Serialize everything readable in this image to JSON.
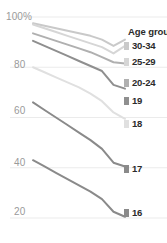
{
  "chart_data": {
    "type": "line",
    "title": "",
    "xlabel": "",
    "ylabel": "",
    "ylim": [
      14,
      104
    ],
    "grid": true,
    "legend_position": "right",
    "legend_title": "Age group",
    "yticks": [
      "100%",
      "80",
      "60",
      "40",
      "20"
    ],
    "ytick_values": [
      100,
      80,
      60,
      40,
      20
    ],
    "x": [
      0,
      1,
      2,
      3,
      4,
      5,
      6,
      7,
      8
    ],
    "series": [
      {
        "name": "30-34",
        "color": "#c9c9c9",
        "values": [
          97.5,
          96.5,
          95.5,
          94.5,
          93.5,
          92.5,
          91.0,
          88.5,
          91.0
        ]
      },
      {
        "name": "25-29",
        "color": "#d6d6d6",
        "values": [
          97.0,
          95.5,
          94.0,
          92.5,
          91.0,
          89.5,
          88.0,
          85.5,
          88.5
        ]
      },
      {
        "name": "20-24",
        "color": "#b0b0b0",
        "values": [
          93.5,
          92.0,
          90.5,
          89.0,
          87.5,
          86.0,
          84.0,
          82.0,
          81.5
        ]
      },
      {
        "name": "19",
        "color": "#8f8f8f",
        "values": [
          90.5,
          88.5,
          86.5,
          84.5,
          82.5,
          80.5,
          78.5,
          73.0,
          71.5
        ]
      },
      {
        "name": "18",
        "color": "#e0e0e0",
        "values": [
          80.0,
          78.0,
          76.0,
          74.0,
          72.0,
          69.5,
          66.5,
          62.0,
          59.5
        ]
      },
      {
        "name": "17",
        "color": "#8a8a8a",
        "values": [
          66.0,
          63.0,
          60.0,
          57.0,
          54.0,
          51.0,
          47.5,
          42.0,
          40.5
        ]
      },
      {
        "name": "16",
        "color": "#8a8a8a",
        "values": [
          43.0,
          40.5,
          38.0,
          35.5,
          33.0,
          30.5,
          27.5,
          22.5,
          20.5
        ]
      }
    ]
  },
  "yaxis": {
    "tick_0": "100%",
    "tick_1": "80",
    "tick_2": "60",
    "tick_3": "40",
    "tick_4": "20"
  },
  "legend": {
    "title": "Age group",
    "items": [
      {
        "label": "30-34",
        "color": "#c9c9c9"
      },
      {
        "label": "25-29",
        "color": "#d6d6d6"
      },
      {
        "label": "20-24",
        "color": "#b0b0b0"
      },
      {
        "label": "19",
        "color": "#8f8f8f"
      },
      {
        "label": "18",
        "color": "#e0e0e0"
      },
      {
        "label": "17",
        "color": "#8a8a8a"
      },
      {
        "label": "16",
        "color": "#8a8a8a"
      }
    ]
  },
  "colors": {
    "background": "#ffffff",
    "gridline": "#ebebeb",
    "ytick_text": "#9a9a9a",
    "legend_text": "#2b2b2b"
  }
}
